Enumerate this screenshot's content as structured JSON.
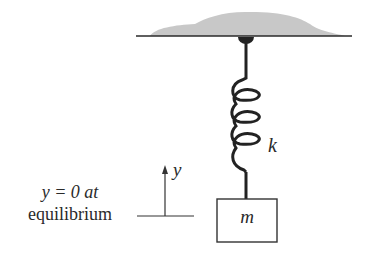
{
  "diagram": {
    "spring_label": "k",
    "mass_label": "m",
    "axis_label": "y",
    "equilibrium_note_line1": "y = 0 at",
    "equilibrium_note_line2": "equilibrium",
    "colors": {
      "line": "#2a2a2a",
      "ceiling_fill": "#c8c8c8",
      "background": "#ffffff"
    }
  }
}
